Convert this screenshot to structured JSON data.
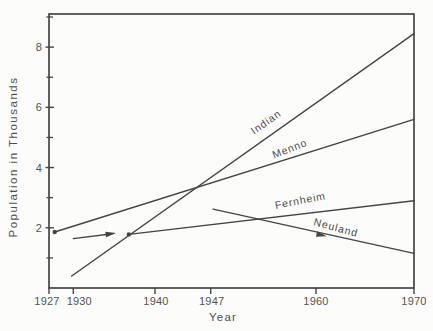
{
  "figure": {
    "background": "#fcfcfb",
    "ink_color": "#454545",
    "text_color": "#525252"
  },
  "chart_data": {
    "type": "line",
    "title": "",
    "xlabel": "Year",
    "ylabel": "Population in Thousands",
    "xlim": [
      1927,
      1970
    ],
    "ylim": [
      0,
      9.1
    ],
    "grid": false,
    "legend": "labels-on-lines",
    "x_ticks": [
      {
        "year": 1927,
        "label": "1927",
        "label_dx": -2
      },
      {
        "year": 1930,
        "label": "1930",
        "label_dx": 6
      },
      {
        "year": 1940,
        "label": "1940",
        "label_dx": 1
      },
      {
        "year": 1947,
        "label": "1947",
        "label_dx": 1
      },
      {
        "year": 1960,
        "label": "1960",
        "label_dx": 0
      },
      {
        "year": 1970,
        "label": "1970",
        "label_dx": 0
      }
    ],
    "x_anchors": [
      {
        "year": 1927,
        "frac": 0.0
      },
      {
        "year": 1930,
        "frac": 0.0666
      },
      {
        "year": 1940,
        "frac": 0.2904
      },
      {
        "year": 1947,
        "frac": 0.443
      },
      {
        "year": 1960,
        "frac": 0.7315
      },
      {
        "year": 1970,
        "frac": 1.0
      }
    ],
    "y_major_ticks": [
      2,
      4,
      6,
      8
    ],
    "y_minor_ticks": [
      1,
      3,
      5,
      7,
      9
    ],
    "layout": {
      "left": 49,
      "top": 14,
      "right": 414,
      "bottom": 288
    },
    "series": [
      {
        "name": "Indian",
        "segments": [
          [
            [
              1929.8,
              0.4
            ],
            [
              1970,
              8.45
            ]
          ]
        ],
        "dots": [],
        "arrows": [],
        "label": {
          "text": "Indian",
          "x": 268,
          "y": 125,
          "angle": -35
        }
      },
      {
        "name": "Menno",
        "segments": [
          [
            [
              1927.7,
              1.86
            ],
            [
              1970,
              5.6
            ]
          ]
        ],
        "dots": [
          [
            1927.7,
            1.86
          ]
        ],
        "arrows": [],
        "label": {
          "text": "Menno",
          "x": 291,
          "y": 152,
          "angle": -21
        }
      },
      {
        "name": "Fernheim",
        "segments": [
          [
            [
              1930,
              1.64
            ],
            [
              1934.8,
              1.8
            ]
          ],
          [
            [
              1936.8,
              1.78
            ],
            [
              1970,
              2.9
            ]
          ]
        ],
        "dots": [
          [
            1936.8,
            1.78
          ]
        ],
        "arrows": [
          {
            "year": 1934.5,
            "value": 1.8,
            "angle": -8
          }
        ],
        "label": {
          "text": "Fernheim",
          "x": 301,
          "y": 204,
          "angle": -11
        }
      },
      {
        "name": "Neuland",
        "segments": [
          [
            [
              1947.3,
              2.62
            ],
            [
              1970,
              1.15
            ]
          ]
        ],
        "dots": [],
        "arrows": [
          {
            "year": 1960.5,
            "value": 1.76,
            "angle": 13
          }
        ],
        "label": {
          "text": "Neuland",
          "x": 335,
          "y": 231,
          "angle": 15
        }
      }
    ]
  }
}
